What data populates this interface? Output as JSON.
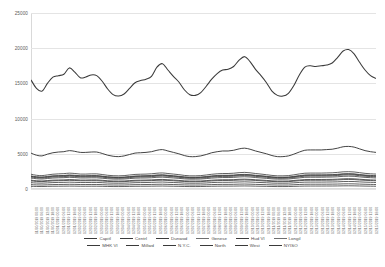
{
  "chart": {
    "type": "line",
    "title": "",
    "xlabel": "",
    "ylabel": ""
  },
  "yaxis": {
    "ticks": [
      "25000",
      "20000",
      "15000",
      "10000",
      "5000",
      "0"
    ],
    "min": 0,
    "max": 25000,
    "step": 5000
  },
  "xaxis": {
    "ticks": [
      "11/30/2019 00:00",
      "11/30/2019 06:00",
      "11/30/2019 12:00",
      "11/30/2019 18:00",
      "12/01/2019 00:00",
      "12/01/2019 06:00",
      "12/01/2019 12:00",
      "12/01/2019 18:00",
      "12/02/2019 00:00",
      "12/02/2019 06:00",
      "12/02/2019 12:00",
      "12/02/2019 18:00",
      "12/03/2019 00:00",
      "12/03/2019 06:00",
      "12/03/2019 12:00",
      "12/03/2019 18:00",
      "12/04/2019 00:00",
      "12/04/2019 06:00",
      "12/04/2019 12:00",
      "12/04/2019 18:00",
      "12/05/2019 00:00",
      "12/05/2019 06:00",
      "12/05/2019 12:00",
      "12/05/2019 18:00",
      "12/06/2019 00:00",
      "12/06/2019 06:00",
      "12/06/2019 12:00",
      "12/06/2019 18:00",
      "12/07/2019 00:00",
      "12/07/2019 06:00",
      "12/07/2019 12:00",
      "12/07/2019 18:00",
      "12/08/2019 00:00",
      "12/08/2019 06:00",
      "12/08/2019 12:00",
      "12/08/2019 18:00",
      "12/09/2019 00:00",
      "12/09/2019 06:00",
      "12/09/2019 12:00",
      "12/09/2019 18:00",
      "12/10/2019 00:00",
      "12/10/2019 06:00",
      "12/10/2019 12:00",
      "12/10/2019 18:00",
      "12/11/2019 00:00",
      "12/11/2019 06:00",
      "12/11/2019 12:00",
      "12/11/2019 18:00",
      "12/12/2019 00:00",
      "12/12/2019 06:00",
      "12/12/2019 12:00",
      "12/12/2019 18:00",
      "12/13/2019 00:00",
      "12/13/2019 06:00",
      "12/13/2019 12:00",
      "12/13/2019 18:00",
      "12/14/2019 00:00",
      "12/14/2019 06:00",
      "12/14/2019 12:00",
      "12/14/2019 18:00",
      "12/15/2019 00:00",
      "12/15/2019 06:00",
      "12/15/2019 12:00",
      "12/15/2019 18:00"
    ]
  },
  "legend": {
    "position": "bottom",
    "rows": [
      [
        {
          "label": "Capitl",
          "color": "#3a3a3a"
        },
        {
          "label": "Centrl",
          "color": "#3a3a3a"
        },
        {
          "label": "Dunwod",
          "color": "#3a3a3a"
        },
        {
          "label": "Genese",
          "color": "#6e6e6e"
        },
        {
          "label": "Hud Vl",
          "color": "#3a3a3a"
        },
        {
          "label": "Longil",
          "color": "#6e6e6e"
        }
      ],
      [
        {
          "label": "MHK Vl",
          "color": "#3a3a3a"
        },
        {
          "label": "Millwd",
          "color": "#3a3a3a"
        },
        {
          "label": "N.Y.C.",
          "color": "#3a3a3a"
        },
        {
          "label": "North",
          "color": "#3a3a3a"
        },
        {
          "label": "West",
          "color": "#3a3a3a"
        },
        {
          "label": "NYISO",
          "color": "#3a3a3a"
        }
      ]
    ]
  },
  "chart_data": {
    "type": "line",
    "title": "",
    "xlabel": "",
    "ylabel": "",
    "ylim": [
      0,
      25000
    ],
    "yticks": [
      0,
      5000,
      10000,
      15000,
      20000,
      25000
    ],
    "grid": true,
    "legend_position": "bottom",
    "x": [
      "11/30/2019 00:00",
      "11/30/2019 06:00",
      "11/30/2019 12:00",
      "11/30/2019 18:00",
      "12/01/2019 00:00",
      "12/01/2019 06:00",
      "12/01/2019 12:00",
      "12/01/2019 18:00",
      "12/02/2019 00:00",
      "12/02/2019 06:00",
      "12/02/2019 12:00",
      "12/02/2019 18:00",
      "12/03/2019 00:00",
      "12/03/2019 06:00",
      "12/03/2019 12:00",
      "12/03/2019 18:00",
      "12/04/2019 00:00",
      "12/04/2019 06:00",
      "12/04/2019 12:00",
      "12/04/2019 18:00",
      "12/05/2019 00:00",
      "12/05/2019 06:00",
      "12/05/2019 12:00",
      "12/05/2019 18:00",
      "12/06/2019 00:00",
      "12/06/2019 06:00",
      "12/06/2019 12:00",
      "12/06/2019 18:00",
      "12/07/2019 00:00",
      "12/07/2019 06:00",
      "12/07/2019 12:00",
      "12/07/2019 18:00",
      "12/08/2019 00:00",
      "12/08/2019 06:00",
      "12/08/2019 12:00",
      "12/08/2019 18:00",
      "12/09/2019 00:00",
      "12/09/2019 06:00",
      "12/09/2019 12:00",
      "12/09/2019 18:00",
      "12/10/2019 00:00",
      "12/10/2019 06:00",
      "12/10/2019 12:00",
      "12/10/2019 18:00",
      "12/11/2019 00:00",
      "12/11/2019 06:00",
      "12/11/2019 12:00",
      "12/11/2019 18:00",
      "12/12/2019 00:00",
      "12/12/2019 06:00",
      "12/12/2019 12:00",
      "12/12/2019 18:00",
      "12/13/2019 00:00",
      "12/13/2019 06:00",
      "12/13/2019 12:00",
      "12/13/2019 18:00",
      "12/14/2019 00:00",
      "12/14/2019 06:00",
      "12/14/2019 12:00",
      "12/14/2019 18:00",
      "12/15/2019 00:00",
      "12/15/2019 06:00",
      "12/15/2019 12:00",
      "12/15/2019 18:00"
    ],
    "series": [
      {
        "name": "NYISO",
        "values": [
          15500,
          14300,
          13900,
          15000,
          15900,
          16100,
          16300,
          17200,
          16600,
          15800,
          15900,
          16200,
          16100,
          15300,
          14200,
          13400,
          13200,
          13500,
          14300,
          15100,
          15400,
          15600,
          16000,
          17300,
          17800,
          16900,
          16000,
          15200,
          14100,
          13400,
          13300,
          13700,
          14600,
          15600,
          16400,
          16900,
          17000,
          17400,
          18300,
          18800,
          18100,
          17000,
          16100,
          15100,
          13900,
          13300,
          13200,
          13600,
          14700,
          16200,
          17300,
          17500,
          17400,
          17500,
          17600,
          17900,
          18700,
          19600,
          19800,
          19200,
          18000,
          16900,
          16100,
          15700
        ]
      },
      {
        "name": "N.Y.C.",
        "values": [
          5100,
          4800,
          4700,
          4950,
          5150,
          5250,
          5300,
          5450,
          5350,
          5200,
          5200,
          5250,
          5250,
          5050,
          4800,
          4650,
          4600,
          4700,
          4900,
          5100,
          5150,
          5200,
          5300,
          5500,
          5600,
          5400,
          5200,
          5000,
          4750,
          4600,
          4600,
          4700,
          4900,
          5150,
          5300,
          5400,
          5400,
          5500,
          5700,
          5800,
          5650,
          5400,
          5200,
          5000,
          4750,
          4600,
          4600,
          4700,
          4950,
          5250,
          5500,
          5550,
          5550,
          5550,
          5600,
          5650,
          5800,
          6000,
          6050,
          5950,
          5700,
          5450,
          5300,
          5200
        ]
      },
      {
        "name": "Longil",
        "values": [
          2100,
          1950,
          1900,
          2000,
          2100,
          2150,
          2180,
          2250,
          2200,
          2120,
          2120,
          2150,
          2150,
          2060,
          1950,
          1890,
          1870,
          1900,
          1990,
          2070,
          2100,
          2120,
          2160,
          2240,
          2280,
          2200,
          2120,
          2040,
          1930,
          1870,
          1870,
          1900,
          1990,
          2090,
          2160,
          2200,
          2200,
          2240,
          2320,
          2360,
          2300,
          2200,
          2120,
          2030,
          1930,
          1870,
          1870,
          1900,
          2010,
          2140,
          2240,
          2260,
          2260,
          2260,
          2280,
          2300,
          2360,
          2440,
          2460,
          2420,
          2320,
          2220,
          2160,
          2120
        ]
      },
      {
        "name": "Hud Vl",
        "values": [
          1800,
          1690,
          1650,
          1730,
          1810,
          1850,
          1870,
          1930,
          1890,
          1830,
          1830,
          1850,
          1850,
          1780,
          1690,
          1640,
          1620,
          1650,
          1720,
          1790,
          1810,
          1830,
          1860,
          1930,
          1960,
          1900,
          1830,
          1760,
          1670,
          1620,
          1620,
          1650,
          1720,
          1800,
          1860,
          1890,
          1890,
          1920,
          1990,
          2020,
          1970,
          1890,
          1830,
          1760,
          1670,
          1620,
          1620,
          1650,
          1740,
          1840,
          1930,
          1950,
          1950,
          1950,
          1960,
          1980,
          2030,
          2100,
          2120,
          2090,
          2000,
          1920,
          1870,
          1830
        ]
      },
      {
        "name": "Capitl",
        "values": [
          1550,
          1460,
          1420,
          1490,
          1560,
          1590,
          1610,
          1660,
          1630,
          1570,
          1570,
          1590,
          1590,
          1530,
          1460,
          1410,
          1400,
          1420,
          1480,
          1540,
          1560,
          1570,
          1600,
          1660,
          1680,
          1630,
          1570,
          1510,
          1440,
          1400,
          1400,
          1420,
          1480,
          1550,
          1600,
          1630,
          1630,
          1650,
          1710,
          1740,
          1700,
          1630,
          1570,
          1510,
          1440,
          1400,
          1400,
          1420,
          1500,
          1580,
          1660,
          1670,
          1670,
          1670,
          1690,
          1700,
          1740,
          1800,
          1820,
          1800,
          1720,
          1650,
          1610,
          1570
        ]
      },
      {
        "name": "Centrl",
        "values": [
          1700,
          1600,
          1560,
          1630,
          1710,
          1740,
          1760,
          1820,
          1790,
          1730,
          1730,
          1750,
          1750,
          1680,
          1600,
          1550,
          1530,
          1560,
          1620,
          1690,
          1710,
          1730,
          1760,
          1820,
          1850,
          1800,
          1730,
          1660,
          1580,
          1530,
          1530,
          1560,
          1620,
          1700,
          1760,
          1790,
          1790,
          1810,
          1880,
          1910,
          1860,
          1790,
          1730,
          1660,
          1580,
          1530,
          1530,
          1560,
          1640,
          1740,
          1820,
          1840,
          1840,
          1840,
          1850,
          1870,
          1920,
          1980,
          2000,
          1980,
          1890,
          1810,
          1770,
          1730
        ]
      },
      {
        "name": "Dunwod",
        "values": [
          1150,
          1080,
          1050,
          1100,
          1160,
          1180,
          1190,
          1230,
          1210,
          1170,
          1170,
          1180,
          1180,
          1140,
          1080,
          1050,
          1040,
          1050,
          1100,
          1140,
          1160,
          1170,
          1190,
          1230,
          1250,
          1210,
          1170,
          1120,
          1070,
          1040,
          1040,
          1050,
          1100,
          1150,
          1190,
          1210,
          1210,
          1230,
          1270,
          1290,
          1260,
          1210,
          1170,
          1120,
          1070,
          1040,
          1040,
          1050,
          1110,
          1180,
          1230,
          1240,
          1240,
          1240,
          1250,
          1260,
          1290,
          1340,
          1350,
          1340,
          1280,
          1230,
          1200,
          1170
        ]
      },
      {
        "name": "Genese",
        "values": [
          1250,
          1170,
          1140,
          1200,
          1260,
          1280,
          1300,
          1340,
          1320,
          1270,
          1270,
          1290,
          1290,
          1240,
          1170,
          1140,
          1130,
          1140,
          1190,
          1240,
          1260,
          1270,
          1300,
          1340,
          1360,
          1320,
          1270,
          1220,
          1160,
          1130,
          1130,
          1140,
          1190,
          1250,
          1300,
          1320,
          1320,
          1330,
          1380,
          1400,
          1370,
          1320,
          1270,
          1220,
          1160,
          1130,
          1130,
          1140,
          1210,
          1280,
          1340,
          1350,
          1350,
          1350,
          1360,
          1370,
          1400,
          1450,
          1470,
          1450,
          1390,
          1330,
          1300,
          1270
        ]
      },
      {
        "name": "MHK Vl",
        "values": [
          900,
          850,
          830,
          870,
          910,
          930,
          940,
          970,
          950,
          920,
          920,
          930,
          930,
          900,
          850,
          830,
          820,
          830,
          860,
          900,
          910,
          920,
          940,
          970,
          990,
          950,
          920,
          890,
          840,
          820,
          820,
          830,
          860,
          910,
          940,
          950,
          950,
          970,
          1000,
          1020,
          990,
          950,
          920,
          890,
          840,
          820,
          820,
          830,
          880,
          930,
          970,
          980,
          980,
          980,
          990,
          1000,
          1020,
          1060,
          1070,
          1060,
          1010,
          970,
          950,
          920
        ]
      },
      {
        "name": "Millwd",
        "values": [
          380,
          360,
          350,
          370,
          390,
          395,
          400,
          410,
          405,
          390,
          390,
          395,
          395,
          380,
          360,
          350,
          348,
          352,
          368,
          382,
          388,
          392,
          398,
          412,
          418,
          404,
          390,
          376,
          356,
          348,
          348,
          352,
          368,
          388,
          400,
          406,
          406,
          412,
          426,
          434,
          422,
          404,
          390,
          376,
          356,
          348,
          348,
          352,
          374,
          396,
          414,
          418,
          418,
          418,
          422,
          426,
          434,
          450,
          454,
          448,
          430,
          412,
          402,
          392
        ]
      },
      {
        "name": "North",
        "values": [
          620,
          585,
          570,
          600,
          628,
          640,
          648,
          668,
          658,
          636,
          636,
          644,
          644,
          620,
          585,
          570,
          564,
          570,
          596,
          620,
          628,
          636,
          648,
          668,
          680,
          656,
          636,
          612,
          580,
          564,
          564,
          570,
          596,
          628,
          648,
          656,
          656,
          668,
          692,
          704,
          684,
          656,
          636,
          612,
          580,
          564,
          564,
          570,
          606,
          642,
          672,
          678,
          678,
          678,
          684,
          692,
          704,
          730,
          738,
          728,
          698,
          670,
          654,
          636
        ]
      },
      {
        "name": "West",
        "values": [
          1850,
          1740,
          1700,
          1780,
          1870,
          1900,
          1920,
          1990,
          1950,
          1880,
          1880,
          1910,
          1910,
          1830,
          1740,
          1690,
          1670,
          1690,
          1770,
          1840,
          1870,
          1890,
          1920,
          1990,
          2020,
          1950,
          1880,
          1810,
          1720,
          1670,
          1670,
          1690,
          1770,
          1860,
          1920,
          1950,
          1950,
          1980,
          2050,
          2080,
          2030,
          1950,
          1880,
          1810,
          1720,
          1670,
          1670,
          1690,
          1790,
          1900,
          1990,
          2010,
          2010,
          2010,
          2020,
          2040,
          2090,
          2160,
          2180,
          2150,
          2060,
          1980,
          1930,
          1890
        ]
      }
    ]
  }
}
